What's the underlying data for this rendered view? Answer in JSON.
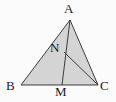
{
  "figure": {
    "kind": "triangle-with-cevians",
    "background_color": "#fbfbfb",
    "fill_color": "#d4d4d4",
    "stroke_color": "#3c3c3c",
    "stroke_width": 1,
    "points": {
      "A": {
        "label": "A",
        "x": 70,
        "y": 20
      },
      "B": {
        "label": "B",
        "x": 21,
        "y": 85
      },
      "C": {
        "label": "C",
        "x": 98,
        "y": 85
      },
      "M": {
        "label": "M",
        "x": 62,
        "y": 85
      },
      "N": {
        "label": "N",
        "x": 64,
        "y": 52
      }
    },
    "polygon": {
      "name": "triangle-ABC",
      "vertices": "70,20 21,85 98,85"
    },
    "segments": [
      {
        "name": "segment-AM",
        "x1": 70,
        "y1": 20,
        "x2": 62,
        "y2": 85
      },
      {
        "name": "segment-NC",
        "x1": 64,
        "y1": 52,
        "x2": 98,
        "y2": 85
      }
    ]
  }
}
